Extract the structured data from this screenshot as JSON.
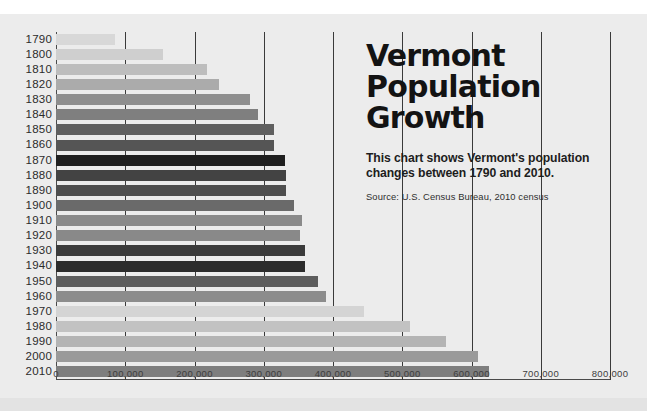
{
  "header": {
    "title_lines": [
      "Vermont",
      "Population",
      "Growth"
    ],
    "title_full": "Vermont Population Growth",
    "subtitle": "This chart shows Vermont's population changes between 1790 and 2010.",
    "source": "Source: U.S. Census Bureau, 2010 census"
  },
  "chart_data": {
    "type": "bar",
    "orientation": "horizontal",
    "subtitle": "This chart shows Vermont's population changes between 1790 and 2010.",
    "source": "Source: U.S. Census Bureau, 2010 census",
    "xlabel": "",
    "ylabel": "",
    "xlim": [
      0,
      800000
    ],
    "xticks": [
      0,
      100000,
      200000,
      300000,
      400000,
      500000,
      600000,
      700000,
      800000
    ],
    "xtick_labels": [
      "0",
      "100,000",
      "200,000",
      "300,000",
      "400,000",
      "500,000",
      "600,000",
      "700,000",
      "800,000"
    ],
    "grid": true,
    "grid_axis": "x",
    "legend": false,
    "categories": [
      "1790",
      "1800",
      "1810",
      "1820",
      "1830",
      "1840",
      "1850",
      "1860",
      "1870",
      "1880",
      "1890",
      "1900",
      "1910",
      "1920",
      "1930",
      "1940",
      "1950",
      "1960",
      "1970",
      "1980",
      "1990",
      "2000",
      "2010"
    ],
    "values": [
      85425,
      154465,
      217895,
      235981,
      280652,
      291948,
      314120,
      315098,
      330551,
      332286,
      332422,
      343641,
      355956,
      352428,
      359611,
      359231,
      377747,
      389881,
      444330,
      511456,
      562758,
      608827,
      625741
    ],
    "bar_colors": [
      "#d8d8d8",
      "#cfcfcf",
      "#bdbdbd",
      "#ababab",
      "#8e8e8e",
      "#7f7f7f",
      "#5f5f5f",
      "#555555",
      "#1f1f1f",
      "#434343",
      "#4e4e4e",
      "#6a6a6a",
      "#8a8a8a",
      "#898989",
      "#3b3b3b",
      "#2c2c2c",
      "#5d5d5d",
      "#8c8c8c",
      "#d4d4d4",
      "#c2c2c2",
      "#b4b4b4",
      "#9a9a9a",
      "#7e7e7e"
    ],
    "background_color": "#ececec",
    "gridline_color": "#3a3a3a",
    "axis_color": "#4a4a4a"
  }
}
